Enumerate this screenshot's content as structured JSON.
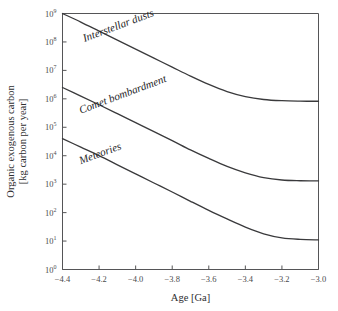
{
  "chart_data": {
    "type": "line",
    "title": "",
    "xlabel": "Age [Ga]",
    "ylabel_line1": "Organic exogenous carbon",
    "ylabel_line2": "[kg carbon per year]",
    "xlim": [
      -4.4,
      -3.0
    ],
    "ylim": [
      1,
      1000000000
    ],
    "yscale": "log",
    "grid": false,
    "legend_position": "inline-curve-labels",
    "xticks": [
      -4.4,
      -4.2,
      -4.0,
      -3.8,
      -3.6,
      -3.4,
      -3.2,
      -3.0
    ],
    "xticklabels": [
      "−4.4",
      "−4.2",
      "−4.0",
      "−3.8",
      "−3.6",
      "−3.4",
      "−3.2",
      "−3.0"
    ],
    "yticks": [
      1,
      10,
      100,
      1000,
      10000,
      100000,
      1000000,
      10000000,
      100000000,
      1000000000
    ],
    "yticklabels": [
      "10",
      "10",
      "10",
      "10",
      "10",
      "10",
      "10",
      "10",
      "10",
      "10"
    ],
    "ytickexponents": [
      "0",
      "1",
      "2",
      "3",
      "4",
      "5",
      "6",
      "7",
      "8",
      "9"
    ],
    "series": [
      {
        "name": "Interstellar dusts",
        "label": "Interstellar dusts",
        "color": "#3a3a3c",
        "x": [
          -4.4,
          -4.3,
          -4.2,
          -4.1,
          -4.0,
          -3.9,
          -3.8,
          -3.7,
          -3.6,
          -3.5,
          -3.4,
          -3.3,
          -3.2,
          -3.1,
          -3.0
        ],
        "y": [
          1000000000,
          500000000,
          240000000,
          115000000,
          56000000,
          27000000,
          13000000,
          6300000,
          3200000,
          1800000,
          1200000,
          950000,
          860000,
          830000,
          820000
        ]
      },
      {
        "name": "Comet bombardment",
        "label": "Comet bombardment",
        "color": "#3a3a3c",
        "x": [
          -4.4,
          -4.3,
          -4.2,
          -4.1,
          -4.0,
          -3.9,
          -3.8,
          -3.7,
          -3.6,
          -3.5,
          -3.4,
          -3.3,
          -3.2,
          -3.1,
          -3.0
        ],
        "y": [
          2500000,
          1250000,
          620000,
          300000,
          145000,
          70000,
          34000,
          16000,
          8000,
          4200,
          2500,
          1700,
          1400,
          1320,
          1300
        ]
      },
      {
        "name": "Meteorites",
        "label": "Meteories",
        "color": "#3a3a3c",
        "x": [
          -4.4,
          -4.3,
          -4.2,
          -4.1,
          -4.0,
          -3.9,
          -3.8,
          -3.7,
          -3.6,
          -3.5,
          -3.4,
          -3.3,
          -3.2,
          -3.1,
          -3.0
        ],
        "y": [
          40000,
          20000,
          10000,
          4800,
          2300,
          1100,
          530,
          250,
          120,
          60,
          31,
          18,
          13,
          11.5,
          11
        ]
      }
    ],
    "annotations": [
      {
        "text": "Interstellar dusts",
        "x": -4.28,
        "y": 100000000,
        "rotation": -20.5
      },
      {
        "text": "Comet bombardment",
        "x": -4.3,
        "y": 300000,
        "rotation": -20.5
      },
      {
        "text": "Meteories",
        "x": -4.3,
        "y": 5000,
        "rotation": -20.5
      }
    ]
  }
}
